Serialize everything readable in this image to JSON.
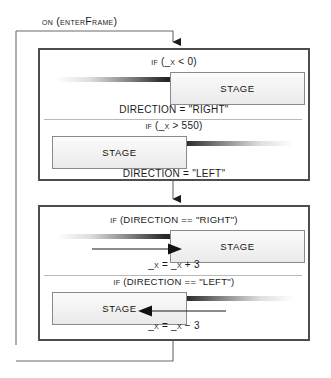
{
  "diagram": {
    "title": "on (enterFrame)",
    "boxes": [
      {
        "id": "boundary-check",
        "branches": [
          {
            "condition": "if (_x < 0)",
            "action": "DIRECTION = \"RIGHT\"",
            "stage_label": "STAGE",
            "stage_side": "right",
            "motion_direction": "right",
            "arrow": "none"
          },
          {
            "condition": "if (_x > 550)",
            "action": "DIRECTION = \"LEFT\"",
            "stage_label": "STAGE",
            "stage_side": "left",
            "motion_direction": "left",
            "arrow": "none"
          }
        ]
      },
      {
        "id": "movement",
        "branches": [
          {
            "condition": "if (DIRECTION == \"RIGHT\")",
            "action": "_x = _x + 3",
            "stage_label": "STAGE",
            "stage_side": "right",
            "motion_direction": "right",
            "arrow": "right"
          },
          {
            "condition": "if (DIRECTION == \"LEFT\")",
            "action": "_x = _x − 3",
            "stage_label": "STAGE",
            "stage_side": "left",
            "motion_direction": "left",
            "arrow": "left"
          }
        ]
      }
    ],
    "colors": {
      "box_border": "#4d4d4d",
      "flow_line": "#555555",
      "divider": "#b9b9b9",
      "text": "#1a1a1a",
      "stage_fill": "#f2f2f2",
      "stage_border": "#8a8a8a"
    }
  }
}
